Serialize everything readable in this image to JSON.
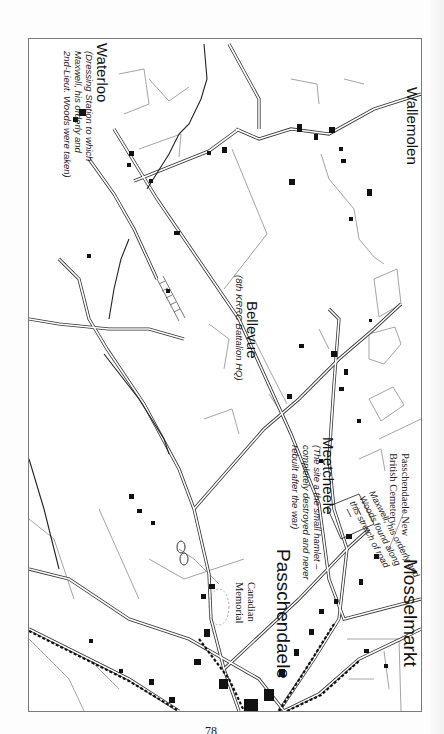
{
  "page": {
    "page_number": "78",
    "orientation": "map rotated 90 degrees clockwise"
  },
  "map": {
    "places": [
      {
        "id": "wallemolen",
        "name": "Wallemolen"
      },
      {
        "id": "waterloo",
        "name": "Waterloo",
        "note": "(Dressing Station to which\nMaxwell, his orderly and\n2nd-Lieut. Woods were taken)"
      },
      {
        "id": "bellevue",
        "name": "Bellevue",
        "note": "(8th KRRC Battalion HQ)"
      },
      {
        "id": "meetcheele",
        "name": "Meetcheele",
        "note": "(The site a the small hamlet –\ncompletely destroyed and never\nrebuilt after the war)"
      },
      {
        "id": "passchendaele",
        "name": "Passchendaele"
      },
      {
        "id": "mosselmarkt",
        "name": "Mosselmarkt"
      }
    ],
    "annotations": {
      "cemetery": "Passchendaele New\nBritish Cemetery",
      "memorial": "Canadian\nMemorial",
      "road_note": "Maxwell, his orderly and\nWoods found along\nthis stretch of road"
    },
    "colors": {
      "road": "#333333",
      "building": "#111111",
      "field": "#9a9a9a",
      "frame": "#7a7a7a"
    }
  }
}
